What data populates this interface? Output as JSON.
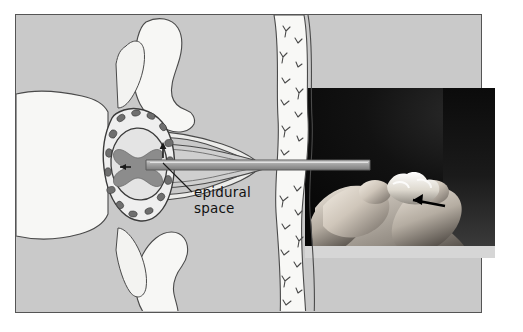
{
  "figure": {
    "kind": "medical-illustration",
    "title_text": "",
    "background_color": "#ffffff",
    "frame": {
      "fill_color": "#c9c9c9",
      "border_color": "#555555"
    }
  },
  "labels": {
    "epidural_line1": "epidural",
    "epidural_line2": "space"
  },
  "diagram": {
    "parts": {
      "vertebral_body": "vertebral-body",
      "spinous_process_superior": "superior-spinous-process",
      "spinous_process_inferior": "inferior-spinous-process",
      "lamina": "lamina",
      "epidural_space_ring": "epidural-space-ring",
      "venous_plexus_dots": "epidural-venous-plexus",
      "dura_mater": "dura-mater",
      "spinal_cord_gray_matter": "spinal-cord-gray-matter",
      "ligamentum_flavum": "ligamentum-flavum",
      "catheter": "epidural-catheter",
      "subcutaneous_tissue_band": "subcutaneous-tissue",
      "skin_surface": "skin-surface",
      "direction_arrow": "insertion-direction-arrow",
      "leader_line": "epidural-space-leader-line"
    },
    "colors": {
      "bone_fill": "#f5f5f3",
      "outline": "#3b3b3b",
      "epidural_ring_fill": "#efefef",
      "venous_dot": "#6f6f6f",
      "dura_fill": "#e8e8e8",
      "cord_gray": "#8c8c8c",
      "catheter_fill": "#9a9a9a",
      "tissue_fill": "#f7f7f5",
      "squiggle": "#4a4a4a"
    }
  },
  "photo": {
    "description_name": "hand-holding-catheter-photograph",
    "background_color": "#0d0d0d",
    "arrow_color": "#000000",
    "skin_highlight_color": "#e9e4dc"
  },
  "edge_text": {
    "line1": "",
    "line2": "",
    "line3": ""
  }
}
